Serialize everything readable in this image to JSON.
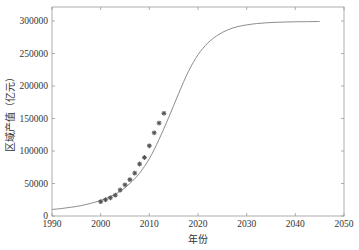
{
  "chart_data": {
    "type": "line",
    "title": "",
    "xlabel": "年份",
    "ylabel": "区域产值（亿元）",
    "xlim": [
      1990,
      2050
    ],
    "ylim": [
      0,
      320000
    ],
    "x_ticks": [
      1990,
      2000,
      2010,
      2020,
      2030,
      2040,
      2050
    ],
    "y_ticks": [
      0,
      50000,
      100000,
      150000,
      200000,
      250000,
      300000
    ],
    "grid": false,
    "legend": null,
    "series": [
      {
        "name": "fitted logistic curve",
        "style": "line",
        "color": "#8c8c8c",
        "x": [
          1990,
          1992,
          1994,
          1996,
          1998,
          2000,
          2002,
          2004,
          2006,
          2008,
          2010,
          2012,
          2014,
          2016,
          2018,
          2020,
          2022,
          2024,
          2026,
          2028,
          2030,
          2032,
          2034,
          2036,
          2038,
          2040,
          2042,
          2045
        ],
        "values": [
          10000,
          11500,
          13500,
          16000,
          19500,
          24000,
          30000,
          38000,
          50000,
          66000,
          88000,
          118000,
          152000,
          188000,
          222000,
          248000,
          266000,
          278000,
          286000,
          291000,
          294000,
          296000,
          297200,
          298000,
          298500,
          298800,
          299000,
          299200
        ]
      },
      {
        "name": "observed data",
        "style": "markers",
        "marker": "asterisk",
        "color": "#555555",
        "x": [
          2000,
          2001,
          2002,
          2003,
          2004,
          2005,
          2006,
          2007,
          2008,
          2009,
          2010,
          2011,
          2012,
          2013
        ],
        "values": [
          22000,
          25000,
          28000,
          32000,
          40000,
          48000,
          56000,
          66000,
          80000,
          90000,
          108000,
          128000,
          143000,
          158000
        ]
      }
    ]
  },
  "labels": {
    "xlabel": "年份",
    "ylabel": "区域产值（亿元）"
  }
}
